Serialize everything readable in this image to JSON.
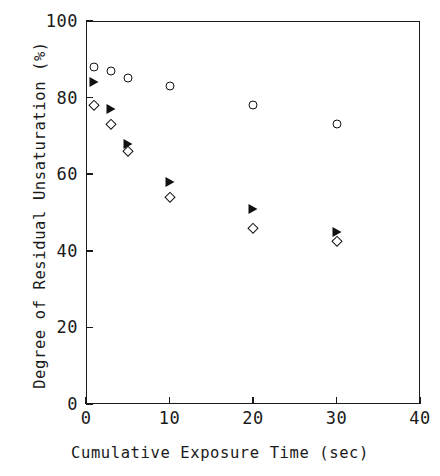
{
  "chart_data": {
    "type": "scatter",
    "title": "",
    "xlabel": "Cumulative Exposure Time (sec)",
    "ylabel": "Degree of Residual Unsaturation  (%)",
    "xlim": [
      0,
      40
    ],
    "ylim": [
      0,
      100
    ],
    "xticks": [
      0,
      10,
      20,
      30,
      40
    ],
    "yticks": [
      0,
      20,
      40,
      60,
      80,
      100
    ],
    "xtick_labels": [
      "0",
      "10",
      "20",
      "30",
      "40"
    ],
    "ytick_labels": [
      "0",
      "20",
      "40",
      "60",
      "80",
      "100"
    ],
    "grid": false,
    "legend": "none",
    "series": [
      {
        "name": "open-circle",
        "marker": "open-circle",
        "color": "#111111",
        "x": [
          1,
          3,
          5,
          10,
          20,
          30
        ],
        "y": [
          88,
          87,
          85,
          83,
          78,
          73
        ]
      },
      {
        "name": "filled-triangle",
        "marker": "filled-right-triangle",
        "color": "#111111",
        "x": [
          1,
          3,
          5,
          10,
          20,
          30
        ],
        "y": [
          84,
          77,
          68,
          58,
          51,
          45
        ]
      },
      {
        "name": "open-diamond",
        "marker": "open-diamond",
        "color": "#111111",
        "x": [
          1,
          3,
          5,
          10,
          20,
          30
        ],
        "y": [
          78,
          73,
          66,
          54,
          46,
          42.5
        ]
      }
    ]
  }
}
